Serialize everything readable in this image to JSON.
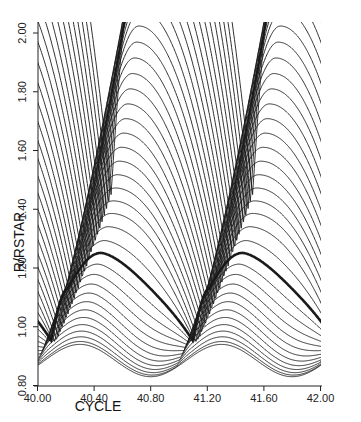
{
  "chart_data": {
    "type": "line",
    "title": "",
    "xlabel": "CYCLE",
    "ylabel": "R/RSTAR",
    "xlim": [
      40.0,
      42.0
    ],
    "ylim": [
      0.8,
      2.05
    ],
    "xticks": [
      "40.00",
      "40.40",
      "40.80",
      "41.20",
      "41.60",
      "42.00"
    ],
    "xtick_values": [
      40.0,
      40.4,
      40.8,
      41.2,
      41.6,
      42.0
    ],
    "yticks": [
      "0.80",
      "1.00",
      "1.20",
      "1.40",
      "1.60",
      "1.80",
      "2.00"
    ],
    "ytick_values": [
      0.8,
      1.0,
      1.2,
      1.4,
      1.6,
      1.8,
      2.0
    ],
    "grid": false,
    "legend": null,
    "shock_phase": 40.95,
    "period": 1.0,
    "n_shells": 42,
    "bold_shell_index": 12,
    "inner_shell": {
      "min_radius": 0.83,
      "max_radius": 0.94
    },
    "bold_shell": {
      "min_radius": 0.9,
      "max_radius": 1.14
    },
    "outer_shell": {
      "min_radius": 1.45,
      "max_radius": 2.05
    }
  },
  "axes": {
    "x_label": "CYCLE",
    "y_label": "R/RSTAR",
    "y_tick_labels": [
      "0.80",
      "1.00",
      "1.20",
      "1.40",
      "1.60",
      "1.80",
      "2.00"
    ],
    "x_tick_labels": [
      "40.00",
      "40.40",
      "40.80",
      "41.20",
      "41.60",
      "42.00"
    ]
  },
  "colors": {
    "line": "#1a1a1a",
    "axis": "#222222",
    "background": "#ffffff"
  }
}
